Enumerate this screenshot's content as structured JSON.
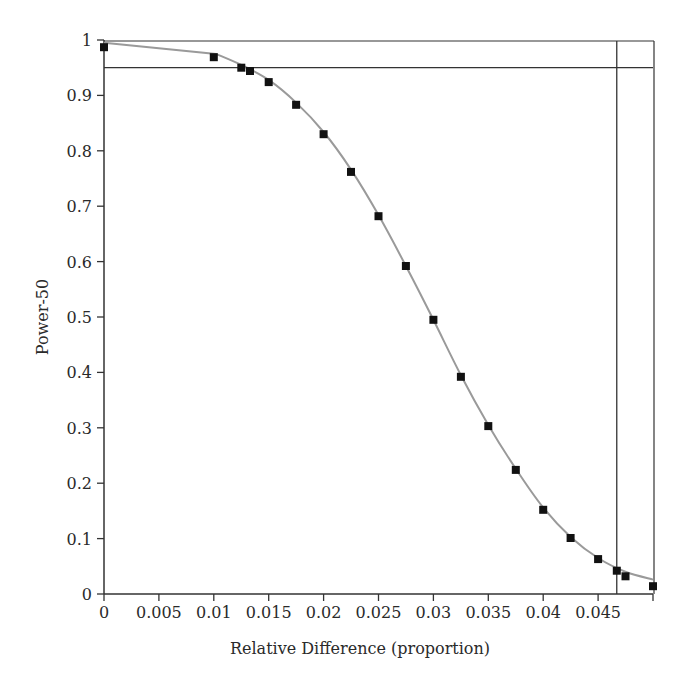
{
  "chart_data": {
    "type": "line",
    "title": "",
    "xlabel": "Relative Difference (proportion)",
    "ylabel": "Power-50",
    "xlim": [
      0,
      0.05
    ],
    "ylim": [
      0,
      1
    ],
    "x_ticks": [
      0,
      0.005,
      0.01,
      0.015,
      0.02,
      0.025,
      0.03,
      0.035,
      0.04,
      0.045,
      0.05
    ],
    "x_tick_labels": [
      "0",
      "0.005",
      "0.01",
      "0.015",
      "0.02",
      "0.025",
      "0.03",
      "0.035",
      "0.04",
      "0.045",
      ""
    ],
    "y_ticks": [
      0,
      0.1,
      0.2,
      0.3,
      0.4,
      0.5,
      0.6,
      0.7,
      0.8,
      0.9,
      1
    ],
    "y_tick_labels": [
      "0",
      "0.1",
      "0.2",
      "0.3",
      "0.4",
      "0.5",
      "0.6",
      "0.7",
      "0.8",
      "0.9",
      "1"
    ],
    "grid": false,
    "legend": null,
    "series": [
      {
        "name": "Power-50 (observed)",
        "marker": "square",
        "color": "#111111",
        "x": [
          0,
          0.01,
          0.0125,
          0.0133,
          0.015,
          0.0175,
          0.02,
          0.0225,
          0.025,
          0.0275,
          0.03,
          0.0325,
          0.035,
          0.0375,
          0.04,
          0.0425,
          0.045,
          0.0467,
          0.0475,
          0.05
        ],
        "values": [
          0.987,
          0.969,
          0.95,
          0.944,
          0.924,
          0.883,
          0.83,
          0.762,
          0.682,
          0.592,
          0.495,
          0.392,
          0.303,
          0.224,
          0.152,
          0.101,
          0.063,
          0.042,
          0.032,
          0.014
        ]
      },
      {
        "name": "Fitted curve",
        "line": "solid",
        "color": "#9a9a9a",
        "x": [
          0,
          0.0102,
          0.0125,
          0.015,
          0.0175,
          0.02,
          0.0225,
          0.025,
          0.0275,
          0.03,
          0.0325,
          0.035,
          0.0375,
          0.04,
          0.0425,
          0.045,
          0.0475,
          0.05
        ],
        "values": [
          0.995,
          0.975,
          0.955,
          0.928,
          0.887,
          0.834,
          0.766,
          0.684,
          0.592,
          0.495,
          0.395,
          0.305,
          0.226,
          0.156,
          0.103,
          0.065,
          0.04,
          0.026
        ]
      }
    ],
    "reference_lines": [
      {
        "orientation": "horizontal",
        "y": 0.95,
        "color": "#333333"
      },
      {
        "orientation": "vertical",
        "x": 0.0467,
        "color": "#333333"
      }
    ],
    "frame": {
      "top_border_at_y": 1,
      "right_border_at_x": 0.05
    }
  }
}
